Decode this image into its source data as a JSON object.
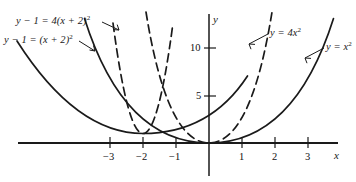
{
  "figure": {
    "title": "",
    "background_color": "#ffffff",
    "ink_color": "#1a1a1a",
    "axis_x_name": "x",
    "axis_y_name": "y"
  },
  "axes": {
    "x_tick_labels": [
      "−3",
      "−2",
      "−1",
      "1",
      "2",
      "3"
    ],
    "x_tick_values": [
      -3,
      -2,
      -1,
      1,
      2,
      3
    ],
    "y_tick_labels": [
      "5",
      "10"
    ],
    "y_tick_values": [
      5,
      10
    ]
  },
  "curve_labels": [
    {
      "id": "shifted-wide",
      "text_html": "y − 1 = (x + 2)<sup>2</sup>",
      "text": "y-1=(x+2)^2"
    },
    {
      "id": "shifted-narrow",
      "text_html": "y − 1 = 4(x + 2)<sup>2</sup>",
      "text": "y-1=4(x+2)^2"
    },
    {
      "id": "narrow",
      "text_html": "y = 4x<sup>2</sup>",
      "text": "y=4x^2"
    },
    {
      "id": "wide",
      "text_html": "y = x<sup>2</sup>",
      "text": "y=x^2"
    }
  ],
  "chart_data": {
    "type": "line",
    "title": "",
    "xlabel": "x",
    "ylabel": "y",
    "xlim": [
      -4.6,
      4.6
    ],
    "ylim": [
      -0.8,
      14.5
    ],
    "grid": false,
    "legend": "inline-annotations",
    "xticks": [
      -3,
      -2,
      -1,
      1,
      2,
      3
    ],
    "yticks": [
      5,
      10
    ],
    "series": [
      {
        "name": "y = x^2",
        "equation": "y = x^2",
        "style": "solid",
        "vertex": [
          0,
          0
        ],
        "x": [
          -3.6,
          -3.2,
          -2.8,
          -2.4,
          -2.0,
          -1.6,
          -1.2,
          -0.8,
          -0.4,
          0,
          0.4,
          0.8,
          1.2,
          1.6,
          2.0,
          2.4,
          2.8,
          3.2,
          3.6
        ],
        "y": [
          12.96,
          10.24,
          7.84,
          5.76,
          4.0,
          2.56,
          1.44,
          0.64,
          0.16,
          0,
          0.16,
          0.64,
          1.44,
          2.56,
          4.0,
          5.76,
          7.84,
          10.24,
          12.96
        ]
      },
      {
        "name": "y = 4x^2",
        "equation": "y = 4x^2",
        "style": "dashed",
        "vertex": [
          0,
          0
        ],
        "x": [
          -1.85,
          -1.6,
          -1.4,
          -1.2,
          -1.0,
          -0.8,
          -0.6,
          -0.4,
          -0.2,
          0,
          0.2,
          0.4,
          0.6,
          0.8,
          1.0,
          1.2,
          1.4,
          1.6,
          1.85
        ],
        "y": [
          13.69,
          10.24,
          7.84,
          5.76,
          4.0,
          2.56,
          1.44,
          0.64,
          0.16,
          0,
          0.16,
          0.64,
          1.44,
          2.56,
          4.0,
          5.76,
          7.84,
          10.24,
          13.69
        ]
      },
      {
        "name": "y - 1 = (x + 2)^2",
        "equation": "y - 1 = (x + 2)^2",
        "style": "solid",
        "vertex": [
          -2,
          1
        ],
        "x": [
          -5.5,
          -5.0,
          -4.5,
          -4.0,
          -3.5,
          -3.0,
          -2.5,
          -2.0,
          -1.5,
          -1.0,
          -0.5,
          0,
          0.5,
          1.0,
          1.5
        ],
        "y": [
          13.25,
          10.0,
          7.25,
          5.0,
          3.25,
          2.0,
          1.25,
          1.0,
          1.25,
          2.0,
          3.25,
          5.0,
          7.25,
          10.0,
          13.25
        ]
      },
      {
        "name": "y - 1 = 4(x + 2)^2",
        "equation": "y - 1 = 4(x + 2)^2",
        "style": "dashed",
        "vertex": [
          -2,
          1
        ],
        "x": [
          -3.8,
          -3.5,
          -3.2,
          -2.9,
          -2.6,
          -2.3,
          -2.0,
          -1.7,
          -1.4,
          -1.1,
          -0.8,
          -0.5,
          -0.2
        ],
        "y": [
          13.96,
          10.0,
          6.76,
          4.24,
          2.44,
          1.36,
          1.0,
          1.36,
          2.44,
          4.24,
          6.76,
          10.0,
          13.96
        ]
      }
    ]
  }
}
